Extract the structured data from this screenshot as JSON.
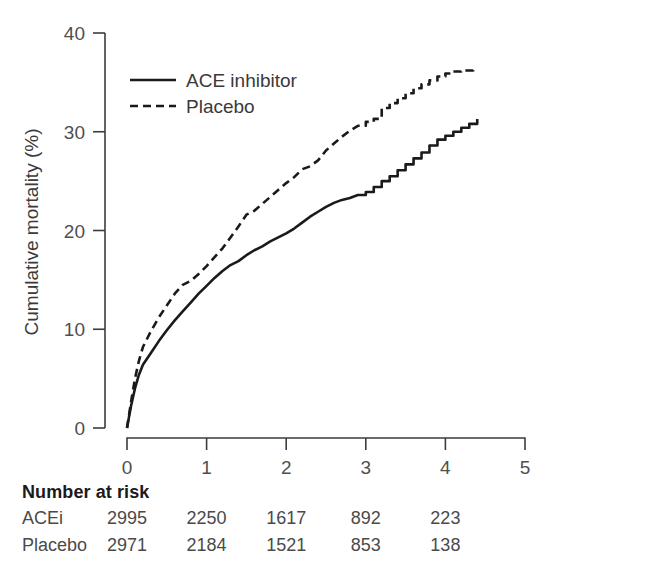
{
  "figure": {
    "kind": "kaplan-meier-cumulative-mortality"
  },
  "chart_data": {
    "type": "line",
    "title": "",
    "xlabel": "",
    "ylabel": "Cumulative mortality (%)",
    "xlim": [
      0,
      5
    ],
    "ylim": [
      0,
      40
    ],
    "xticks": [
      "0",
      "1",
      "2",
      "3",
      "4",
      "5"
    ],
    "yticks": [
      "0",
      "10",
      "20",
      "30",
      "40"
    ],
    "grid": false,
    "legend_position": "top-left-inside",
    "series": [
      {
        "name": "ACE inhibitor",
        "style": "solid",
        "color": "#1a1a1a",
        "x": [
          0,
          0.05,
          0.1,
          0.15,
          0.2,
          0.3,
          0.4,
          0.5,
          0.6,
          0.7,
          0.8,
          0.9,
          1.0,
          1.1,
          1.2,
          1.3,
          1.4,
          1.5,
          1.6,
          1.7,
          1.8,
          1.9,
          2.0,
          2.1,
          2.2,
          2.3,
          2.4,
          2.5,
          2.6,
          2.7,
          2.8,
          2.9,
          3.0,
          3.1,
          3.2,
          3.3,
          3.4,
          3.5,
          3.6,
          3.7,
          3.8,
          3.9,
          4.0,
          4.1,
          4.2,
          4.3,
          4.4
        ],
        "y": [
          0.0,
          2.2,
          4.0,
          5.4,
          6.4,
          7.6,
          8.8,
          9.9,
          10.9,
          11.8,
          12.7,
          13.6,
          14.4,
          15.2,
          15.9,
          16.5,
          16.9,
          17.5,
          18.0,
          18.4,
          18.9,
          19.3,
          19.7,
          20.2,
          20.8,
          21.4,
          21.9,
          22.4,
          22.8,
          23.1,
          23.3,
          23.6,
          23.9,
          24.4,
          25.0,
          25.5,
          26.1,
          26.7,
          27.3,
          27.9,
          28.6,
          29.2,
          29.6,
          30.0,
          30.4,
          30.8,
          31.3
        ]
      },
      {
        "name": "Placebo",
        "style": "dashed",
        "color": "#1a1a1a",
        "x": [
          0,
          0.05,
          0.1,
          0.15,
          0.2,
          0.3,
          0.4,
          0.5,
          0.6,
          0.7,
          0.8,
          0.9,
          1.0,
          1.1,
          1.2,
          1.3,
          1.4,
          1.5,
          1.6,
          1.7,
          1.8,
          1.9,
          2.0,
          2.1,
          2.2,
          2.3,
          2.4,
          2.5,
          2.6,
          2.7,
          2.8,
          2.9,
          3.0,
          3.1,
          3.2,
          3.3,
          3.4,
          3.5,
          3.6,
          3.7,
          3.8,
          3.9,
          4.0,
          4.1,
          4.2,
          4.35
        ],
        "y": [
          0.0,
          2.6,
          5.0,
          6.8,
          8.2,
          9.8,
          11.2,
          12.4,
          13.6,
          14.5,
          14.9,
          15.6,
          16.4,
          17.3,
          18.2,
          19.3,
          20.4,
          21.6,
          22.0,
          22.7,
          23.4,
          24.1,
          24.8,
          25.4,
          26.2,
          26.5,
          27.1,
          28.1,
          28.8,
          29.5,
          30.1,
          30.6,
          31.0,
          31.3,
          32.4,
          32.9,
          33.4,
          33.9,
          34.4,
          34.8,
          35.2,
          35.6,
          35.9,
          36.1,
          36.2,
          36.5
        ]
      }
    ],
    "number_at_risk": {
      "title": "Number at risk",
      "timepoints": [
        0,
        1,
        2,
        3,
        4
      ],
      "rows": [
        {
          "label": "ACEi",
          "values": [
            "2995",
            "2250",
            "1617",
            "892",
            "223"
          ]
        },
        {
          "label": "Placebo",
          "values": [
            "2971",
            "2184",
            "1521",
            "853",
            "138"
          ]
        }
      ]
    }
  }
}
